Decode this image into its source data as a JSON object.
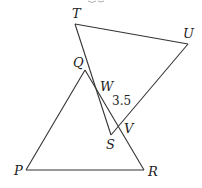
{
  "diagram": {
    "title_partial": "",
    "stroke_color": "#333333",
    "background": "#ffffff",
    "points": {
      "T": {
        "x": 75,
        "y": 24
      },
      "U": {
        "x": 188,
        "y": 44
      },
      "V": {
        "x": 117,
        "y": 128
      },
      "S": {
        "x": 111,
        "y": 135
      },
      "W": {
        "x": 99,
        "y": 96
      },
      "Q": {
        "x": 85,
        "y": 70
      },
      "P": {
        "x": 26,
        "y": 170
      },
      "R": {
        "x": 144,
        "y": 170
      }
    },
    "labels": {
      "T": "T",
      "U": "U",
      "Q": "Q",
      "W": "W",
      "V": "V",
      "S": "S",
      "P": "P",
      "R": "R"
    },
    "measurement": {
      "segment": "WV",
      "value": "3.5"
    },
    "shapes": [
      {
        "name": "triangle-PQR",
        "vertices": [
          "P",
          "Q",
          "R"
        ]
      },
      {
        "name": "quadrilateral-TUVS",
        "vertices": [
          "T",
          "U",
          "V",
          "S"
        ]
      }
    ]
  }
}
